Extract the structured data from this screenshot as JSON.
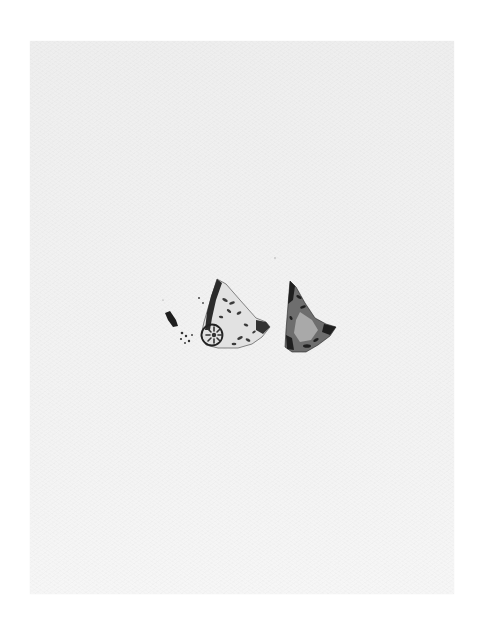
{
  "image": {
    "description": "Photograph of a light gray plate showing two triangular decorated fragments with a few small detached specks",
    "colors": {
      "background": "#ffffff",
      "plate": "#f0f0f0",
      "fragment_dark": "#2a2a2a",
      "fragment_mid": "#7a7a7a",
      "fragment_light": "#d8d8d8"
    },
    "objects": [
      {
        "name": "left-fragment",
        "label": "Fragment with circular rosette motif"
      },
      {
        "name": "right-fragment",
        "label": "Darker triangular fragment"
      },
      {
        "name": "detached-specks",
        "label": "Small loose pieces"
      }
    ]
  }
}
